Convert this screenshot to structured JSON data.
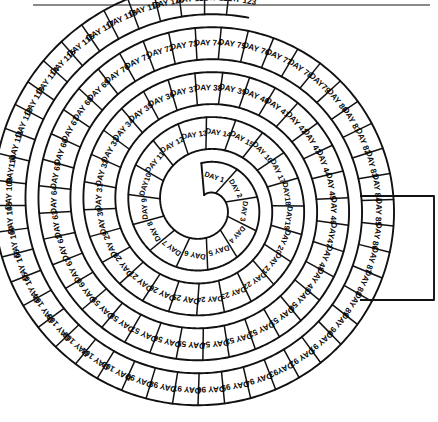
{
  "figure": {
    "kind": "spiral-day-chart",
    "title_rule_color": "#8a8a8a",
    "ink_color": "#111111",
    "background_color": "#ffffff",
    "label_prefix": "DAY",
    "first_day": 1,
    "last_day": 123,
    "total_cells": 123
  },
  "geometry": {
    "center_x": 205,
    "center_y": 205,
    "start_radius": 26,
    "ring_pitch": 45,
    "band_half_width": 16,
    "turns": 4.05,
    "start_angle_deg": 95
  },
  "tab": {
    "label_from": 119,
    "label_to": 123,
    "x": 360,
    "y": 196,
    "width": 74,
    "height": 104
  },
  "cells": [
    {
      "n": 1,
      "label": "DAY 1"
    },
    {
      "n": 2,
      "label": "DAY 2"
    },
    {
      "n": 3,
      "label": "DAY 3"
    },
    {
      "n": 4,
      "label": "DAY 4"
    },
    {
      "n": 5,
      "label": "DAY 5"
    },
    {
      "n": 6,
      "label": "DAY 6"
    },
    {
      "n": 7,
      "label": "DAY 7"
    },
    {
      "n": 8,
      "label": "DAY 8"
    },
    {
      "n": 9,
      "label": "DAY 9"
    },
    {
      "n": 10,
      "label": "DAY10"
    },
    {
      "n": 11,
      "label": "DAY 11"
    },
    {
      "n": 12,
      "label": "DAY 12"
    },
    {
      "n": 13,
      "label": "DAY 13"
    },
    {
      "n": 14,
      "label": "DAY 14"
    },
    {
      "n": 15,
      "label": "DAY 15"
    },
    {
      "n": 16,
      "label": "DAY 16"
    },
    {
      "n": 17,
      "label": "DAY 17"
    },
    {
      "n": 18,
      "label": "DAY18"
    },
    {
      "n": 19,
      "label": "DAY19"
    },
    {
      "n": 20,
      "label": "DAY 20"
    },
    {
      "n": 21,
      "label": "DAY 21"
    },
    {
      "n": 22,
      "label": "DAY 22"
    },
    {
      "n": 23,
      "label": "DAY 23"
    },
    {
      "n": 24,
      "label": "DAY 24"
    },
    {
      "n": 25,
      "label": "DAY 25"
    },
    {
      "n": 26,
      "label": "DAY 26"
    },
    {
      "n": 27,
      "label": "DAY 27"
    },
    {
      "n": 28,
      "label": "DAY 28"
    },
    {
      "n": 29,
      "label": "DAY 29"
    },
    {
      "n": 30,
      "label": "DAY 30"
    },
    {
      "n": 31,
      "label": "DAY 31"
    },
    {
      "n": 32,
      "label": "DAY 32"
    },
    {
      "n": 33,
      "label": "DAY 33"
    },
    {
      "n": 34,
      "label": "DAY 34"
    },
    {
      "n": 35,
      "label": "DAY 35"
    },
    {
      "n": 36,
      "label": "DAY 36"
    },
    {
      "n": 37,
      "label": "DAY 37"
    },
    {
      "n": 38,
      "label": "DAY 38"
    },
    {
      "n": 39,
      "label": "DAY 39"
    },
    {
      "n": 40,
      "label": "DAY 40"
    },
    {
      "n": 41,
      "label": "DAY 41"
    },
    {
      "n": 42,
      "label": "DAY 42"
    },
    {
      "n": 43,
      "label": "DAY 43"
    },
    {
      "n": 44,
      "label": "DAY 44"
    },
    {
      "n": 45,
      "label": "DAY 45"
    },
    {
      "n": 46,
      "label": "DAY 46"
    },
    {
      "n": 47,
      "label": "DAY47"
    },
    {
      "n": 48,
      "label": "DAY 48"
    },
    {
      "n": 49,
      "label": "DAY 49"
    },
    {
      "n": 50,
      "label": "DAY 50"
    },
    {
      "n": 51,
      "label": "DAY 51"
    },
    {
      "n": 52,
      "label": "DAY 52"
    },
    {
      "n": 53,
      "label": "DAY 53"
    },
    {
      "n": 54,
      "label": "DAY 54"
    },
    {
      "n": 55,
      "label": "DAY 55"
    },
    {
      "n": 56,
      "label": "DAY 56"
    },
    {
      "n": 57,
      "label": "DAY 57"
    },
    {
      "n": 58,
      "label": "DAY 58"
    },
    {
      "n": 59,
      "label": "DAY 59"
    },
    {
      "n": 60,
      "label": "DAY 60"
    },
    {
      "n": 61,
      "label": "DAY 61"
    },
    {
      "n": 62,
      "label": "DAY 62"
    },
    {
      "n": 63,
      "label": "DAY 63"
    },
    {
      "n": 64,
      "label": "DAY 64"
    },
    {
      "n": 65,
      "label": "DAY 65"
    },
    {
      "n": 66,
      "label": "DAY 66"
    },
    {
      "n": 67,
      "label": "DAY 67"
    },
    {
      "n": 68,
      "label": "DAY 68"
    },
    {
      "n": 69,
      "label": "DAY 69"
    },
    {
      "n": 70,
      "label": "DAY 70"
    },
    {
      "n": 71,
      "label": "DAY 71"
    },
    {
      "n": 72,
      "label": "DAY 72"
    },
    {
      "n": 73,
      "label": "DAY 73"
    },
    {
      "n": 74,
      "label": "DAY 74"
    },
    {
      "n": 75,
      "label": "DAY 75"
    },
    {
      "n": 76,
      "label": "DAY 76"
    },
    {
      "n": 77,
      "label": "DAY 77"
    },
    {
      "n": 78,
      "label": "DAY 78"
    },
    {
      "n": 79,
      "label": "DAY79"
    },
    {
      "n": 80,
      "label": "DAY 80"
    },
    {
      "n": 81,
      "label": "DAY 81"
    },
    {
      "n": 82,
      "label": "DAY 82"
    },
    {
      "n": 83,
      "label": "DAY 83"
    },
    {
      "n": 84,
      "label": "DAY 84"
    },
    {
      "n": 85,
      "label": "DAY 85"
    },
    {
      "n": 86,
      "label": "DAY 86"
    },
    {
      "n": 87,
      "label": "DAY 87"
    },
    {
      "n": 88,
      "label": "DAY 88"
    },
    {
      "n": 89,
      "label": "DAY 89"
    },
    {
      "n": 90,
      "label": "DAY 90"
    },
    {
      "n": 91,
      "label": "DAY 91"
    },
    {
      "n": 92,
      "label": "DAY 92"
    },
    {
      "n": 93,
      "label": "DAY93"
    },
    {
      "n": 94,
      "label": "DAY 94"
    },
    {
      "n": 95,
      "label": "DAY 95"
    },
    {
      "n": 96,
      "label": "DAY 96"
    },
    {
      "n": 97,
      "label": "DAY 97"
    },
    {
      "n": 98,
      "label": "DAY 98"
    },
    {
      "n": 99,
      "label": "DAY 99"
    },
    {
      "n": 100,
      "label": "DAY 100"
    },
    {
      "n": 101,
      "label": "DAY 101"
    },
    {
      "n": 102,
      "label": "DAY 102"
    },
    {
      "n": 103,
      "label": "DAY 103"
    },
    {
      "n": 104,
      "label": "DAY 104"
    },
    {
      "n": 105,
      "label": "DAY 105"
    },
    {
      "n": 106,
      "label": "DAY 106"
    },
    {
      "n": 107,
      "label": "DAY 107"
    },
    {
      "n": 108,
      "label": "DAY 108"
    },
    {
      "n": 109,
      "label": "DAY 109"
    },
    {
      "n": 110,
      "label": "DAY110"
    },
    {
      "n": 111,
      "label": "DAY 111"
    },
    {
      "n": 112,
      "label": "DAY 112"
    },
    {
      "n": 113,
      "label": "DAY 113"
    },
    {
      "n": 114,
      "label": "DAY 114"
    },
    {
      "n": 115,
      "label": "DAY 115"
    },
    {
      "n": 116,
      "label": "DAY 116"
    },
    {
      "n": 117,
      "label": "DAY 117"
    },
    {
      "n": 118,
      "label": "DAY 118"
    },
    {
      "n": 119,
      "label": "DAY 119"
    },
    {
      "n": 120,
      "label": "DAY 120"
    },
    {
      "n": 121,
      "label": "DAY 121"
    },
    {
      "n": 122,
      "label": "DAY 122"
    },
    {
      "n": 123,
      "label": "DAY 123"
    }
  ]
}
